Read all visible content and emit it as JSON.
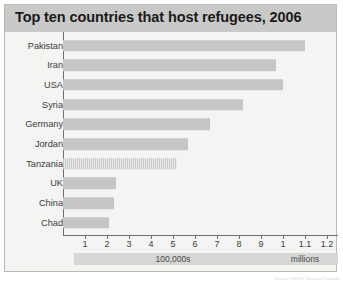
{
  "chart": {
    "title": "Top ten countries that host refugees, 2006",
    "source_note": "Source: UNHCR Statistical Yearbook"
  },
  "colors": {
    "title_bar": "#c9c9c7",
    "bar_fill": "#c6c6c6",
    "plot_background": "#f4f4f2",
    "axis": "#6d6d6d",
    "scale_band": "#d7d7d5",
    "frame_border": "#b9b9b5"
  },
  "chart_data": {
    "type": "bar",
    "orientation": "horizontal",
    "title": "Top ten countries that host refugees, 2006",
    "xlabel": "",
    "ylabel": "",
    "categories": [
      "Pakistan",
      "Iran",
      "USA",
      "Syria",
      "Germany",
      "Jordan",
      "Tanzania",
      "UK",
      "China",
      "Chad"
    ],
    "values": [
      1100000,
      970000,
      1000000,
      820000,
      670000,
      570000,
      520000,
      240000,
      230000,
      210000
    ],
    "value_unit": "refugees",
    "xlim": [
      0,
      1250000
    ],
    "grid": false,
    "legend": false,
    "axis_ticks": [
      {
        "label": "1",
        "value": 100000,
        "band": "100,000s"
      },
      {
        "label": "2",
        "value": 200000,
        "band": "100,000s"
      },
      {
        "label": "3",
        "value": 300000,
        "band": "100,000s"
      },
      {
        "label": "4",
        "value": 400000,
        "band": "100,000s"
      },
      {
        "label": "5",
        "value": 500000,
        "band": "100,000s"
      },
      {
        "label": "6",
        "value": 600000,
        "band": "100,000s"
      },
      {
        "label": "7",
        "value": 700000,
        "band": "100,000s"
      },
      {
        "label": "8",
        "value": 800000,
        "band": "100,000s"
      },
      {
        "label": "9",
        "value": 900000,
        "band": "100,000s"
      },
      {
        "label": "1",
        "value": 1000000,
        "band": "millions"
      },
      {
        "label": "1.1",
        "value": 1100000,
        "band": "millions"
      },
      {
        "label": "1.2",
        "value": 1200000,
        "band": "millions"
      }
    ],
    "scale_bands": [
      {
        "label": "100,000s",
        "from_tick": 1,
        "to_tick": 9
      },
      {
        "label": "millions",
        "from_tick": 10,
        "to_tick": 12
      }
    ]
  }
}
